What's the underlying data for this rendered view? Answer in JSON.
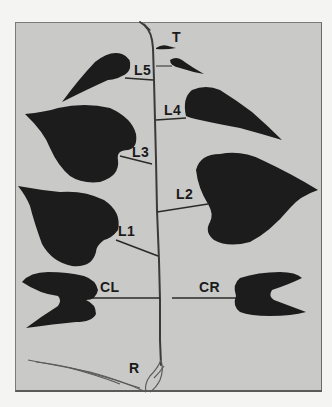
{
  "image": {
    "subject": "Seedling plant with labeled leaves",
    "background_color": "#c9c9c7",
    "leaf_color": "#1c1c1c",
    "page_color": "#f4f4f2"
  },
  "labels": {
    "T": "T",
    "L5": "L5",
    "L4": "L4",
    "L3": "L3",
    "L2": "L2",
    "L1": "L1",
    "CL": "CL",
    "CR": "CR",
    "R": "R"
  }
}
